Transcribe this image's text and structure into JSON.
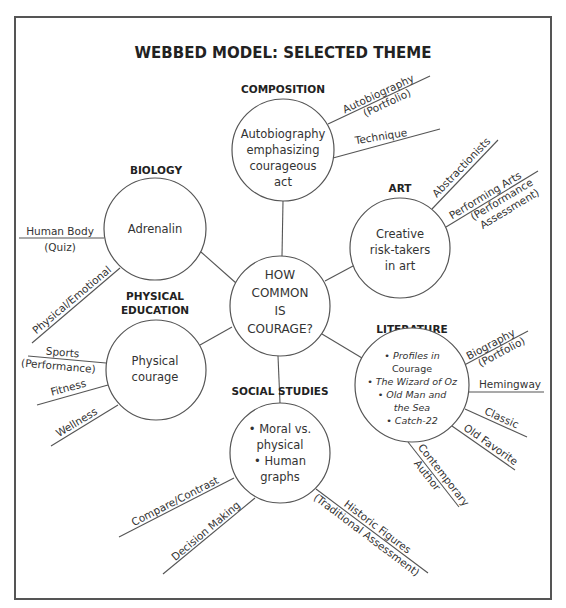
{
  "title": "WEBBED MODEL: SELECTED THEME",
  "center": {
    "lines": [
      "HOW",
      "COMMON",
      "IS",
      "COURAGE?"
    ]
  },
  "subjects": {
    "composition": {
      "heading": "COMPOSITION",
      "lines": [
        "Autobiography",
        "emphasizing",
        "courageous",
        "act"
      ],
      "spokes": [
        {
          "line1": "Autobiography",
          "line2": "(Portfolio)"
        },
        {
          "line1": "Technique"
        }
      ]
    },
    "art": {
      "heading": "ART",
      "lines": [
        "Creative",
        "risk-takers",
        "in art"
      ],
      "spokes": [
        {
          "line1": "Abstractionists"
        },
        {
          "line1": "Performing Arts",
          "line2": "(Performance",
          "line3": "Assessment)"
        }
      ]
    },
    "biology": {
      "heading": "BIOLOGY",
      "lines": [
        "Adrenalin"
      ],
      "spokes": [
        {
          "line1": "Human Body",
          "line2": "(Quiz)"
        },
        {
          "line1": "Physical/Emotional"
        }
      ]
    },
    "physical_education": {
      "heading_line1": "PHYSICAL",
      "heading_line2": "EDUCATION",
      "lines": [
        "Physical",
        "courage"
      ],
      "spokes": [
        {
          "line1": "Sports",
          "line2": "(Performance)"
        },
        {
          "line1": "Fitness"
        },
        {
          "line1": "Wellness"
        }
      ]
    },
    "literature": {
      "heading": "LITERATURE",
      "lines": [
        "• Profiles in",
        "Courage",
        "• The Wizard of Oz",
        "• Old Man and",
        "the Sea",
        "• Catch-22"
      ],
      "spokes": [
        {
          "line1": "Biography",
          "line2": "(Portfolio)"
        },
        {
          "line1": "Hemingway"
        },
        {
          "line1": "Classic"
        },
        {
          "line1": "Old Favorite"
        },
        {
          "line1": "Contemporary",
          "line2": "Author"
        }
      ]
    },
    "social_studies": {
      "heading": "SOCIAL STUDIES",
      "lines": [
        "• Moral vs.",
        "physical",
        "• Human",
        "graphs"
      ],
      "spokes": [
        {
          "line1": "Compare/Contrast"
        },
        {
          "line1": "Decision Making"
        },
        {
          "line1": "Historic Figures",
          "line2": "(Traditional Assessment)"
        }
      ]
    }
  },
  "colors": {
    "stroke": "#555555",
    "text": "#333333",
    "heading": "#222222",
    "background": "#ffffff"
  }
}
